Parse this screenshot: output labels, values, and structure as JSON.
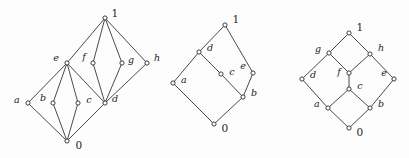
{
  "figure": {
    "background_color": "#fdfdfd",
    "stroke_color": "#2b2b2b",
    "node_fill": "#ffffff",
    "width": 409,
    "height": 158
  },
  "diagrams": [
    {
      "id": "diagram-1",
      "name": "lattice-left",
      "nodes": [
        {
          "id": "top",
          "label": "1",
          "x": 105,
          "y": 18,
          "lx": 115,
          "ly": 13,
          "kind": "number"
        },
        {
          "id": "e",
          "label": "e",
          "x": 67,
          "y": 63,
          "lx": 56,
          "ly": 58,
          "kind": "letter"
        },
        {
          "id": "f",
          "label": "f",
          "x": 93,
          "y": 63,
          "lx": 84,
          "ly": 57,
          "kind": "letter"
        },
        {
          "id": "g",
          "label": "g",
          "x": 122,
          "y": 63,
          "lx": 131,
          "ly": 60,
          "kind": "letter"
        },
        {
          "id": "h",
          "label": "h",
          "x": 147,
          "y": 63,
          "lx": 157,
          "ly": 58,
          "kind": "letter"
        },
        {
          "id": "a",
          "label": "a",
          "x": 28,
          "y": 103,
          "lx": 17,
          "ly": 100,
          "kind": "letter"
        },
        {
          "id": "b",
          "label": "b",
          "x": 53,
          "y": 103,
          "lx": 43,
          "ly": 98,
          "kind": "letter"
        },
        {
          "id": "c",
          "label": "c",
          "x": 78,
          "y": 103,
          "lx": 89,
          "ly": 100,
          "kind": "letter"
        },
        {
          "id": "d",
          "label": "d",
          "x": 105,
          "y": 103,
          "lx": 115,
          "ly": 99,
          "kind": "letter"
        },
        {
          "id": "bot",
          "label": "0",
          "x": 67,
          "y": 141,
          "lx": 79,
          "ly": 145,
          "kind": "number"
        }
      ],
      "edges": [
        [
          "top",
          "e"
        ],
        [
          "top",
          "f"
        ],
        [
          "top",
          "g"
        ],
        [
          "top",
          "h"
        ],
        [
          "e",
          "a"
        ],
        [
          "e",
          "b"
        ],
        [
          "e",
          "c"
        ],
        [
          "e",
          "d"
        ],
        [
          "f",
          "d"
        ],
        [
          "g",
          "d"
        ],
        [
          "h",
          "d"
        ],
        [
          "a",
          "bot"
        ],
        [
          "b",
          "bot"
        ],
        [
          "c",
          "bot"
        ],
        [
          "d",
          "bot"
        ]
      ]
    },
    {
      "id": "diagram-2",
      "name": "lattice-middle",
      "nodes": [
        {
          "id": "top",
          "label": "1",
          "x": 225,
          "y": 25,
          "lx": 236,
          "ly": 19,
          "kind": "number"
        },
        {
          "id": "d",
          "label": "d",
          "x": 199,
          "y": 52,
          "lx": 210,
          "ly": 48,
          "kind": "letter"
        },
        {
          "id": "e",
          "label": "e",
          "x": 253,
          "y": 73,
          "lx": 243,
          "ly": 66,
          "kind": "letter"
        },
        {
          "id": "c",
          "label": "c",
          "x": 221,
          "y": 74,
          "lx": 232,
          "ly": 72,
          "kind": "letter"
        },
        {
          "id": "a",
          "label": "a",
          "x": 173,
          "y": 83,
          "lx": 184,
          "ly": 80,
          "kind": "letter"
        },
        {
          "id": "b",
          "label": "b",
          "x": 243,
          "y": 97,
          "lx": 254,
          "ly": 93,
          "kind": "letter"
        },
        {
          "id": "bot",
          "label": "0",
          "x": 214,
          "y": 124,
          "lx": 225,
          "ly": 128,
          "kind": "number"
        }
      ],
      "edges": [
        [
          "top",
          "d"
        ],
        [
          "top",
          "e"
        ],
        [
          "d",
          "a"
        ],
        [
          "d",
          "c"
        ],
        [
          "c",
          "b"
        ],
        [
          "e",
          "b"
        ],
        [
          "a",
          "bot"
        ],
        [
          "b",
          "bot"
        ]
      ]
    },
    {
      "id": "diagram-3",
      "name": "lattice-right",
      "nodes": [
        {
          "id": "top",
          "label": "1",
          "x": 349,
          "y": 33,
          "lx": 360,
          "ly": 27,
          "kind": "number"
        },
        {
          "id": "g",
          "label": "g",
          "x": 329,
          "y": 53,
          "lx": 318,
          "ly": 49,
          "kind": "letter"
        },
        {
          "id": "h",
          "label": "h",
          "x": 370,
          "y": 54,
          "lx": 381,
          "ly": 48,
          "kind": "letter"
        },
        {
          "id": "d",
          "label": "d",
          "x": 302,
          "y": 79,
          "lx": 313,
          "ly": 75,
          "kind": "letter"
        },
        {
          "id": "f",
          "label": "f",
          "x": 349,
          "y": 73,
          "lx": 339,
          "ly": 72,
          "kind": "letter"
        },
        {
          "id": "e",
          "label": "e",
          "x": 394,
          "y": 79,
          "lx": 384,
          "ly": 73,
          "kind": "letter"
        },
        {
          "id": "c",
          "label": "c",
          "x": 349,
          "y": 89,
          "lx": 360,
          "ly": 86,
          "kind": "letter"
        },
        {
          "id": "a",
          "label": "a",
          "x": 328,
          "y": 108,
          "lx": 317,
          "ly": 104,
          "kind": "letter"
        },
        {
          "id": "b",
          "label": "b",
          "x": 370,
          "y": 108,
          "lx": 381,
          "ly": 104,
          "kind": "letter"
        },
        {
          "id": "bot",
          "label": "0",
          "x": 349,
          "y": 128,
          "lx": 360,
          "ly": 132,
          "kind": "number"
        }
      ],
      "edges": [
        [
          "top",
          "g"
        ],
        [
          "top",
          "h"
        ],
        [
          "g",
          "d"
        ],
        [
          "g",
          "f"
        ],
        [
          "h",
          "f"
        ],
        [
          "h",
          "e"
        ],
        [
          "f",
          "c"
        ],
        [
          "d",
          "a"
        ],
        [
          "c",
          "a"
        ],
        [
          "c",
          "b"
        ],
        [
          "e",
          "b"
        ],
        [
          "a",
          "bot"
        ],
        [
          "b",
          "bot"
        ]
      ]
    }
  ]
}
